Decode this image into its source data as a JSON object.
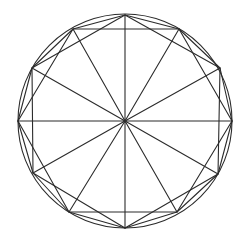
{
  "diagram": {
    "title": "",
    "stroke_color": "#2b2b2b",
    "background_color": "#ffffff",
    "circle": {
      "cx": 125,
      "cy": 121,
      "r": 107
    },
    "center": {
      "x": 125,
      "y": 121
    },
    "vertices": [
      {
        "id": "v0",
        "x": 125,
        "y": 15
      },
      {
        "id": "v1",
        "x": 179,
        "y": 29
      },
      {
        "id": "v2",
        "x": 220,
        "y": 68
      },
      {
        "id": "v3",
        "x": 232,
        "y": 121
      },
      {
        "id": "v4",
        "x": 218,
        "y": 174
      },
      {
        "id": "v5",
        "x": 177,
        "y": 212
      },
      {
        "id": "v6",
        "x": 125,
        "y": 228
      },
      {
        "id": "v7",
        "x": 69,
        "y": 212
      },
      {
        "id": "v8",
        "x": 33,
        "y": 173
      },
      {
        "id": "v9",
        "x": 18,
        "y": 121
      },
      {
        "id": "v10",
        "x": 32,
        "y": 68
      },
      {
        "id": "v11",
        "x": 73,
        "y": 29
      }
    ],
    "polygons": {
      "dodecagon": [
        "v0",
        "v1",
        "v2",
        "v3",
        "v4",
        "v5",
        "v6",
        "v7",
        "v8",
        "v9",
        "v10",
        "v11"
      ],
      "hexagon_a": [
        "v1",
        "v3",
        "v5",
        "v7",
        "v9",
        "v11"
      ],
      "hexagon_b": [
        "v0",
        "v2",
        "v4",
        "v6",
        "v8",
        "v10"
      ]
    },
    "spokes": [
      "v0",
      "v1",
      "v2",
      "v3",
      "v4",
      "v5",
      "v6",
      "v7",
      "v8",
      "v9",
      "v10",
      "v11"
    ],
    "labels": []
  }
}
